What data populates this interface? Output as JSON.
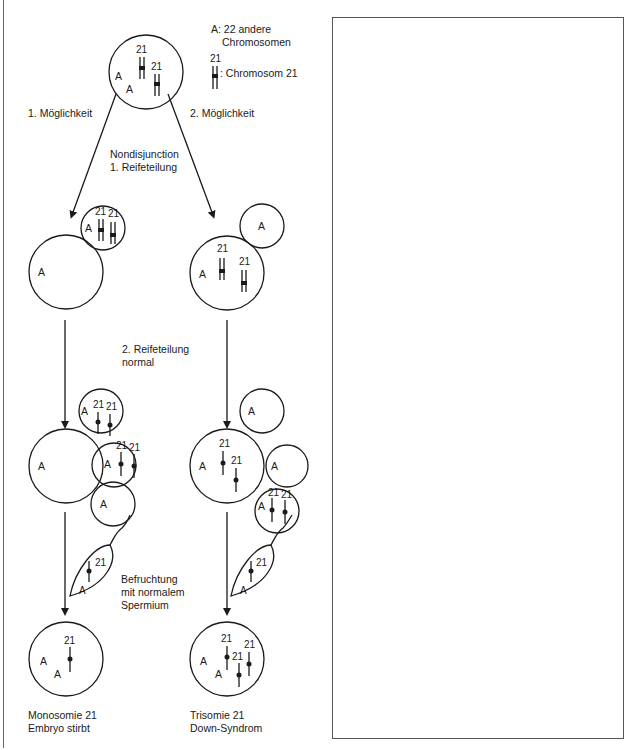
{
  "legend": {
    "a_label": "A: 22 andere",
    "a_label_line2": "Chromosomen",
    "chr_number": "21",
    "chr_label": ": Chromosom 21"
  },
  "paths": {
    "left_label": "1. Möglichkeit",
    "right_label": "2. Möglichkeit"
  },
  "steps": {
    "nondisjunction_line1": "Nondisjunction",
    "nondisjunction_line2": "1. Reifeteilung",
    "second_division_line1": "2. Reifeteilung",
    "second_division_line2": "normal",
    "fertilization_line1": "Befruchtung",
    "fertilization_line2": "mit normalem",
    "fertilization_line3": "Spermium"
  },
  "cell_labels": {
    "other": "A",
    "chr21": "21"
  },
  "results": {
    "left_line1": "Monosomie 21",
    "left_line2": "Embryo stirbt",
    "right_line1": "Trisomie 21",
    "right_line2": "Down-Syndrom"
  },
  "answer_box": {
    "content": ""
  }
}
